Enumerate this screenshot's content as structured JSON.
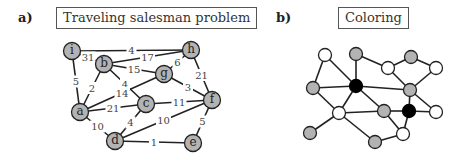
{
  "panels": {
    "a": {
      "label": "a)",
      "title": "Traveling salesman problem",
      "nodes": [
        {
          "id": "i",
          "x": 72,
          "y": 51
        },
        {
          "id": "b",
          "x": 104,
          "y": 64
        },
        {
          "id": "h",
          "x": 191,
          "y": 50
        },
        {
          "id": "g",
          "x": 164,
          "y": 74
        },
        {
          "id": "a",
          "x": 80,
          "y": 112
        },
        {
          "id": "c",
          "x": 146,
          "y": 104
        },
        {
          "id": "f",
          "x": 212,
          "y": 100
        },
        {
          "id": "d",
          "x": 115,
          "y": 141
        },
        {
          "id": "e",
          "x": 193,
          "y": 143
        }
      ],
      "edges": [
        {
          "from": "i",
          "to": "h",
          "weight": "4"
        },
        {
          "from": "i",
          "to": "b",
          "weight": "31"
        },
        {
          "from": "i",
          "to": "a",
          "weight": "5"
        },
        {
          "from": "b",
          "to": "h",
          "weight": "17"
        },
        {
          "from": "b",
          "to": "g",
          "weight": "15"
        },
        {
          "from": "b",
          "to": "c",
          "weight": "4"
        },
        {
          "from": "b",
          "to": "a",
          "weight": "2"
        },
        {
          "from": "h",
          "to": "g",
          "weight": "6"
        },
        {
          "from": "h",
          "to": "f",
          "weight": "21"
        },
        {
          "from": "g",
          "to": "f",
          "weight": "3"
        },
        {
          "from": "g",
          "to": "a",
          "weight": "14"
        },
        {
          "from": "a",
          "to": "c",
          "weight": "21"
        },
        {
          "from": "a",
          "to": "d",
          "weight": "10"
        },
        {
          "from": "c",
          "to": "f",
          "weight": "11"
        },
        {
          "from": "c",
          "to": "d",
          "weight": "4"
        },
        {
          "from": "d",
          "to": "f",
          "weight": "10"
        },
        {
          "from": "d",
          "to": "e",
          "weight": "1"
        },
        {
          "from": "f",
          "to": "e",
          "weight": "5"
        }
      ]
    },
    "b": {
      "label": "b)",
      "title": "Coloring",
      "colors": {
        "gray": "#b3b3b3",
        "white": "#ffffff",
        "black": "#000000"
      },
      "nodes": [
        {
          "id": "n1",
          "x": 325,
          "y": 55,
          "color": "white"
        },
        {
          "id": "n2",
          "x": 356,
          "y": 54,
          "color": "gray"
        },
        {
          "id": "n3",
          "x": 388,
          "y": 68,
          "color": "white"
        },
        {
          "id": "n4",
          "x": 411,
          "y": 57,
          "color": "gray"
        },
        {
          "id": "n5",
          "x": 436,
          "y": 68,
          "color": "white"
        },
        {
          "id": "n6",
          "x": 313,
          "y": 88,
          "color": "gray"
        },
        {
          "id": "n7",
          "x": 356,
          "y": 86,
          "color": "black"
        },
        {
          "id": "n8",
          "x": 410,
          "y": 90,
          "color": "gray"
        },
        {
          "id": "n9",
          "x": 339,
          "y": 113,
          "color": "white"
        },
        {
          "id": "n10",
          "x": 384,
          "y": 111,
          "color": "gray"
        },
        {
          "id": "n11",
          "x": 409,
          "y": 111,
          "color": "black"
        },
        {
          "id": "n12",
          "x": 436,
          "y": 112,
          "color": "white"
        },
        {
          "id": "n13",
          "x": 310,
          "y": 133,
          "color": "gray"
        },
        {
          "id": "n14",
          "x": 375,
          "y": 142,
          "color": "gray"
        },
        {
          "id": "n15",
          "x": 403,
          "y": 134,
          "color": "white"
        }
      ],
      "edges": [
        [
          "n1",
          "n6"
        ],
        [
          "n1",
          "n7"
        ],
        [
          "n2",
          "n7"
        ],
        [
          "n2",
          "n3"
        ],
        [
          "n3",
          "n4"
        ],
        [
          "n4",
          "n5"
        ],
        [
          "n3",
          "n8"
        ],
        [
          "n5",
          "n8"
        ],
        [
          "n6",
          "n7"
        ],
        [
          "n7",
          "n8"
        ],
        [
          "n6",
          "n9"
        ],
        [
          "n7",
          "n9"
        ],
        [
          "n7",
          "n10"
        ],
        [
          "n8",
          "n11"
        ],
        [
          "n8",
          "n12"
        ],
        [
          "n9",
          "n10"
        ],
        [
          "n10",
          "n11"
        ],
        [
          "n11",
          "n12"
        ],
        [
          "n9",
          "n13"
        ],
        [
          "n9",
          "n14"
        ],
        [
          "n10",
          "n15"
        ],
        [
          "n11",
          "n15"
        ],
        [
          "n14",
          "n15"
        ]
      ]
    }
  }
}
